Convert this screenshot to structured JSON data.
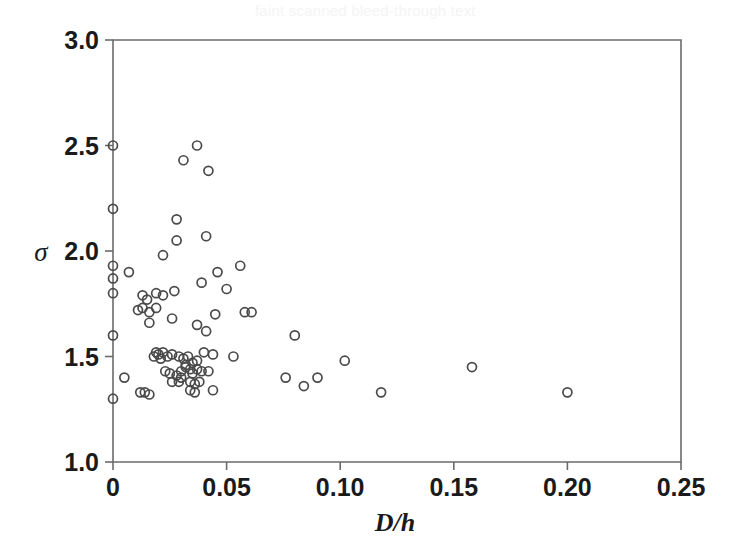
{
  "figure": {
    "background_color": "#ffffff",
    "frame_color": "#6b6b6b",
    "marker_color": "#4a4a4a",
    "text_color": "#1a1a1a",
    "bleed_through_artifact": "faint scanned bleed-through text",
    "plot_area_px": {
      "left": 113,
      "top": 40,
      "right": 681,
      "bottom": 462
    }
  },
  "chart_data": {
    "type": "scatter",
    "title": "",
    "subtitle": "",
    "xlabel": "D/h",
    "ylabel": "σ",
    "xlim": [
      0,
      0.25
    ],
    "ylim": [
      1.0,
      3.0
    ],
    "xticks": [
      0,
      0.05,
      0.1,
      0.15,
      0.2,
      0.25
    ],
    "xticklabels": [
      "0",
      "0.05",
      "0.10",
      "0.15",
      "0.20",
      "0.25"
    ],
    "yticks": [
      1.0,
      1.5,
      2.0,
      2.5,
      3.0
    ],
    "yticklabels": [
      "1.0",
      "1.5",
      "2.0",
      "2.5",
      "3.0"
    ],
    "grid": false,
    "legend": null,
    "legend_position": "none",
    "marker_style": "open-circle",
    "marker_size_px": 9,
    "n_points": 82,
    "series": [
      {
        "name": "data",
        "points": [
          [
            0.0,
            2.5
          ],
          [
            0.0,
            2.2
          ],
          [
            0.0,
            1.93
          ],
          [
            0.0,
            1.87
          ],
          [
            0.0,
            1.8
          ],
          [
            0.0,
            1.6
          ],
          [
            0.0,
            1.3
          ],
          [
            0.037,
            2.5
          ],
          [
            0.031,
            2.43
          ],
          [
            0.042,
            2.38
          ],
          [
            0.028,
            2.15
          ],
          [
            0.028,
            2.05
          ],
          [
            0.041,
            2.07
          ],
          [
            0.022,
            1.98
          ],
          [
            0.007,
            1.9
          ],
          [
            0.056,
            1.93
          ],
          [
            0.046,
            1.9
          ],
          [
            0.039,
            1.85
          ],
          [
            0.05,
            1.82
          ],
          [
            0.013,
            1.79
          ],
          [
            0.015,
            1.77
          ],
          [
            0.019,
            1.8
          ],
          [
            0.022,
            1.79
          ],
          [
            0.027,
            1.81
          ],
          [
            0.013,
            1.73
          ],
          [
            0.019,
            1.73
          ],
          [
            0.016,
            1.71
          ],
          [
            0.011,
            1.72
          ],
          [
            0.045,
            1.7
          ],
          [
            0.058,
            1.71
          ],
          [
            0.061,
            1.71
          ],
          [
            0.016,
            1.66
          ],
          [
            0.026,
            1.68
          ],
          [
            0.037,
            1.65
          ],
          [
            0.041,
            1.62
          ],
          [
            0.08,
            1.6
          ],
          [
            0.019,
            1.52
          ],
          [
            0.02,
            1.51
          ],
          [
            0.022,
            1.52
          ],
          [
            0.024,
            1.5
          ],
          [
            0.026,
            1.51
          ],
          [
            0.029,
            1.5
          ],
          [
            0.031,
            1.49
          ],
          [
            0.033,
            1.5
          ],
          [
            0.035,
            1.47
          ],
          [
            0.037,
            1.48
          ],
          [
            0.04,
            1.52
          ],
          [
            0.044,
            1.51
          ],
          [
            0.053,
            1.5
          ],
          [
            0.102,
            1.48
          ],
          [
            0.158,
            1.45
          ],
          [
            0.023,
            1.43
          ],
          [
            0.025,
            1.42
          ],
          [
            0.028,
            1.41
          ],
          [
            0.03,
            1.43
          ],
          [
            0.032,
            1.45
          ],
          [
            0.034,
            1.44
          ],
          [
            0.035,
            1.42
          ],
          [
            0.037,
            1.44
          ],
          [
            0.039,
            1.43
          ],
          [
            0.042,
            1.43
          ],
          [
            0.005,
            1.4
          ],
          [
            0.076,
            1.4
          ],
          [
            0.09,
            1.4
          ],
          [
            0.026,
            1.38
          ],
          [
            0.029,
            1.38
          ],
          [
            0.034,
            1.38
          ],
          [
            0.036,
            1.37
          ],
          [
            0.038,
            1.38
          ],
          [
            0.084,
            1.36
          ],
          [
            0.012,
            1.33
          ],
          [
            0.014,
            1.33
          ],
          [
            0.016,
            1.32
          ],
          [
            0.034,
            1.34
          ],
          [
            0.036,
            1.33
          ],
          [
            0.044,
            1.34
          ],
          [
            0.118,
            1.33
          ],
          [
            0.2,
            1.33
          ],
          [
            0.032,
            1.46
          ],
          [
            0.03,
            1.4
          ],
          [
            0.021,
            1.49
          ],
          [
            0.018,
            1.5
          ]
        ]
      }
    ]
  }
}
